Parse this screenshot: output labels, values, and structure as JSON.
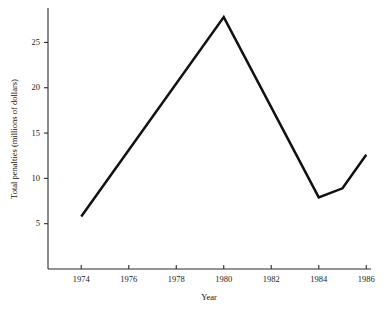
{
  "chart_data": {
    "type": "line",
    "title": "",
    "subtitle": "",
    "xlabel": "Year",
    "ylabel": "Total penalties (millions of dollars)",
    "x": [
      1974,
      1980,
      1984,
      1985,
      1986
    ],
    "values": [
      5.8,
      27.8,
      7.9,
      8.9,
      12.6
    ],
    "series": [
      {
        "name": "Total penalties",
        "x": [
          1974,
          1980,
          1984,
          1985,
          1986
        ],
        "values": [
          5.8,
          27.8,
          7.9,
          8.9,
          12.6
        ],
        "color": "#111111"
      }
    ],
    "xlim": [
      1972.6,
      1986.2
    ],
    "ylim": [
      0.0,
      28.8
    ],
    "xticks": [
      1974,
      1976,
      1978,
      1980,
      1982,
      1984,
      1986
    ],
    "xticklabels": [
      "1974",
      "1976",
      "1978",
      "1980",
      "1982",
      "1984",
      "1986"
    ],
    "yticks": [
      5,
      10,
      15,
      20,
      25
    ],
    "yticklabels": [
      "5",
      "10",
      "15",
      "20",
      "25"
    ],
    "grid": false,
    "legend": false,
    "legend_position": "none",
    "annotations": [],
    "line_color": "#111111",
    "axis_color": "#2b2b2b",
    "background_color": "#ffffff"
  }
}
